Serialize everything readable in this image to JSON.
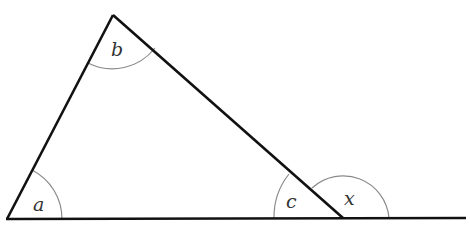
{
  "diagram": {
    "type": "triangle-exterior-angle",
    "colors": {
      "line": "#111111",
      "arc": "#8a8a8a",
      "label": "#333333",
      "background": "#ffffff"
    },
    "vertices": {
      "top": [
        113,
        15
      ],
      "bottom_left": [
        7,
        219
      ],
      "bottom_right": [
        343,
        218
      ]
    },
    "baseline_extension_end": [
      466,
      218
    ],
    "angles": [
      {
        "id": "a",
        "label": "a",
        "vertex": "bottom_left"
      },
      {
        "id": "b",
        "label": "b",
        "vertex": "top"
      },
      {
        "id": "c",
        "label": "c",
        "vertex": "bottom_right",
        "kind": "interior"
      },
      {
        "id": "x",
        "label": "x",
        "vertex": "bottom_right",
        "kind": "exterior"
      }
    ]
  }
}
